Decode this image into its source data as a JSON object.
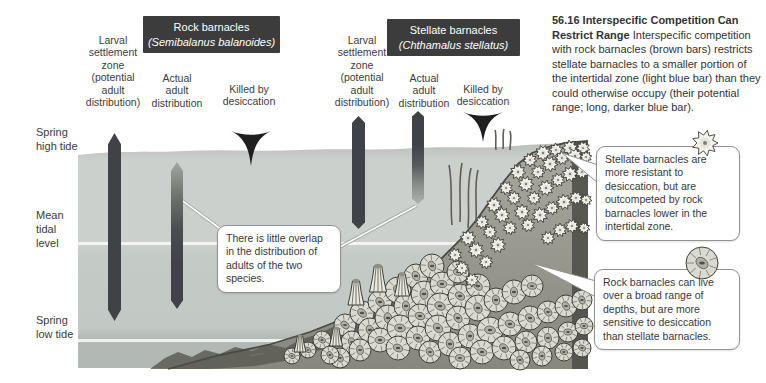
{
  "figure_caption": {
    "title": "56.16 Interspecific Competition Can Restrict Range",
    "body": "Interspecific competition with rock barnacles (brown bars) restricts stellate barnacles to a smaller portion of the intertidal zone (light blue bar) than they could otherwise occupy (their potential range; long, darker blue bar)."
  },
  "groups": [
    {
      "name": "Rock barnacles",
      "species": "(Semibalanus balanoides)"
    },
    {
      "name": "Stellate barnacles",
      "species": "(Chthamalus stellatus)"
    }
  ],
  "column_labels": {
    "larval": "Larval\nsettlement\nzone\n(potential\nadult\ndistribution)",
    "actual": "Actual\nadult\ndistribution",
    "killed": "Killed by\ndesiccation"
  },
  "tide_labels": {
    "spring_high": "Spring\nhigh tide",
    "mean": "Mean\ntidal\nlevel",
    "spring_low": "Spring\nlow tide"
  },
  "callouts": {
    "overlap": "There is little overlap in the distribution of adults of the two species.",
    "stellate": "Stellate barnacles are more resistant to desiccation, but are outcompeted by rock barnacles lower in the intertidal zone.",
    "rock": "Rock barnacles can live over a broad range of depths, but are more sensitive to desiccation than stellate barnacles."
  },
  "bars": [
    {
      "group": "rock barnacles",
      "bar": "larval settlement zone (potential adult distribution)",
      "appearance": "solid dark bar spanning nearly the whole intertidal zone"
    },
    {
      "group": "rock barnacles",
      "bar": "actual adult distribution",
      "appearance": "bar fades toward its top (upper zone killed by desiccation)"
    },
    {
      "group": "stellate barnacles",
      "bar": "larval settlement zone (potential adult distribution)",
      "appearance": "solid dark bar in the upper intertidal zone"
    },
    {
      "group": "stellate barnacles",
      "bar": "actual adult distribution",
      "appearance": "bar fades toward its bottom (outcompeted by rock barnacles)"
    }
  ],
  "colors": {
    "header_bg": "#3c3c3c",
    "header_text": "#ffffff",
    "bar_dark": "#3f4246",
    "water": "#c9cec9",
    "text": "#3a3a3a",
    "callout_border": "#8f948f"
  }
}
